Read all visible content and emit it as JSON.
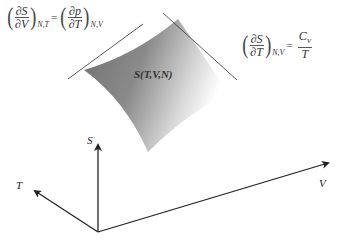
{
  "diagram": {
    "surface_label": "S(T,V,N)",
    "axes": {
      "s_label": "S",
      "t_label": "T",
      "v_label": "V"
    },
    "equation_left": {
      "lhs_num": "∂S",
      "lhs_den": "∂V",
      "lhs_sub": "N,T",
      "equals": "=",
      "rhs_num": "∂p",
      "rhs_den": "∂T",
      "rhs_sub": "N,V"
    },
    "equation_right": {
      "lhs_num": "∂S",
      "lhs_den": "∂T",
      "lhs_sub": "N,V",
      "equals": "=",
      "rhs_num": "C_V",
      "rhs_num_main": "C",
      "rhs_num_sub": "V",
      "rhs_den": "T"
    },
    "colors": {
      "surface_dark": "#6e6e6e",
      "surface_light": "#ffffff",
      "line": "#222222"
    }
  }
}
